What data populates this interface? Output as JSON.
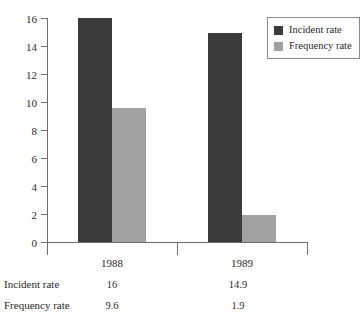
{
  "chart_data": {
    "type": "bar",
    "title": "",
    "subtitle": "",
    "xlabel": "",
    "ylabel": "",
    "categories": [
      "1988",
      "1989"
    ],
    "series": [
      {
        "name": "Incident rate",
        "values": [
          16,
          14.9
        ],
        "color": "#3b3b3b"
      },
      {
        "name": "Frequency rate",
        "values": [
          9.6,
          1.9
        ],
        "color": "#a2a2a2"
      }
    ],
    "ylim": [
      0,
      16
    ],
    "ytick_values": [
      0,
      2,
      4,
      6,
      8,
      10,
      12,
      14,
      16
    ],
    "ytick_labels": [
      "0",
      "2",
      "4",
      "6",
      "8",
      "10",
      "12",
      "14",
      "16"
    ],
    "grid": false,
    "legend_position": "top-right"
  },
  "legend": {
    "entries": [
      {
        "label": "Incident rate",
        "swatch": "dark-swatch-icon"
      },
      {
        "label": "Frequency rate",
        "swatch": "light-swatch-icon"
      }
    ]
  },
  "data_table": {
    "rows": [
      {
        "label": "Incident rate",
        "values": [
          "16",
          "14.9"
        ]
      },
      {
        "label": "Frequency rate",
        "values": [
          "9.6",
          "1.9"
        ]
      }
    ]
  }
}
